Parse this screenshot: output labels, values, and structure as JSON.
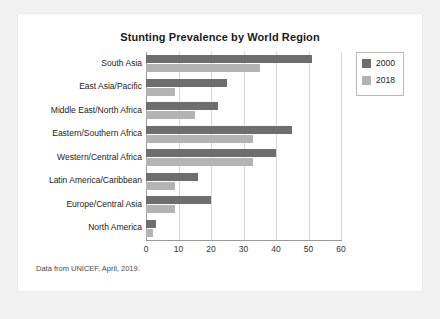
{
  "card": {
    "footnote": "Data from UNICEF, April, 2019."
  },
  "legend": {
    "position": "top-right",
    "entries": [
      {
        "label": "2000",
        "color": "#6e6e6e"
      },
      {
        "label": "2018",
        "color": "#b3b3b3"
      }
    ]
  },
  "colors": {
    "series_2000": "#6e6e6e",
    "series_2018": "#b3b3b3",
    "axis": "#9a9a9a",
    "grid": "#d6d6d6",
    "card_background": "#ffffff",
    "page_background": "#f2f2f2",
    "title_text": "#1b1b1b"
  },
  "chart_data": {
    "type": "bar",
    "orientation": "horizontal",
    "title": "Stunting Prevalence by World Region",
    "subtitle": "",
    "xlabel": "",
    "ylabel": "",
    "xlim": [
      0,
      60
    ],
    "xticks": [
      0,
      10,
      20,
      30,
      40,
      50,
      60
    ],
    "xticklabels": [
      "0",
      "10",
      "20",
      "30",
      "40",
      "50",
      "60"
    ],
    "grid": true,
    "grid_axis": "x",
    "legend_position": "top-right",
    "categories": [
      "South Asia",
      "East Asia/Pacific",
      "Middle East/North Africa",
      "Eastern/Southern Africa",
      "Western/Central Africa",
      "Latin America/Caribbean",
      "Europe/Central Asia",
      "North America"
    ],
    "series": [
      {
        "name": "2000",
        "color": "#6e6e6e",
        "values": [
          51,
          25,
          22,
          45,
          40,
          16,
          20,
          3
        ]
      },
      {
        "name": "2018",
        "color": "#b3b3b3",
        "values": [
          35,
          9,
          15,
          33,
          33,
          9,
          9,
          2
        ]
      }
    ],
    "annotations": [
      "Data from UNICEF, April, 2019."
    ]
  }
}
